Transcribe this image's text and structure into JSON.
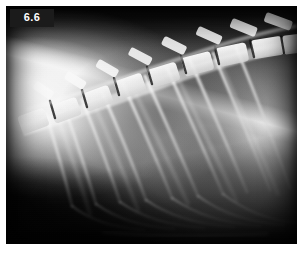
{
  "figure": {
    "number": "6.6",
    "label_text_color": "#ffffff",
    "label_background_color": "#1b1b1b"
  },
  "image": {
    "kind": "radiograph",
    "modality": "x-ray",
    "view": "lateral",
    "region": "thorax",
    "subject": "animal",
    "background_color": "#ffffff",
    "film_black": "#000000",
    "bone_white": "#ffffff"
  },
  "anatomy": {
    "structures": [
      "thoracic vertebrae",
      "spinous processes",
      "intervertebral disc spaces",
      "ribs",
      "costochondral junctions",
      "scapula",
      "lung field",
      "diaphragm",
      "sternum"
    ]
  },
  "frame": {
    "x": 6,
    "y": 6,
    "width": 291,
    "height": 238
  }
}
